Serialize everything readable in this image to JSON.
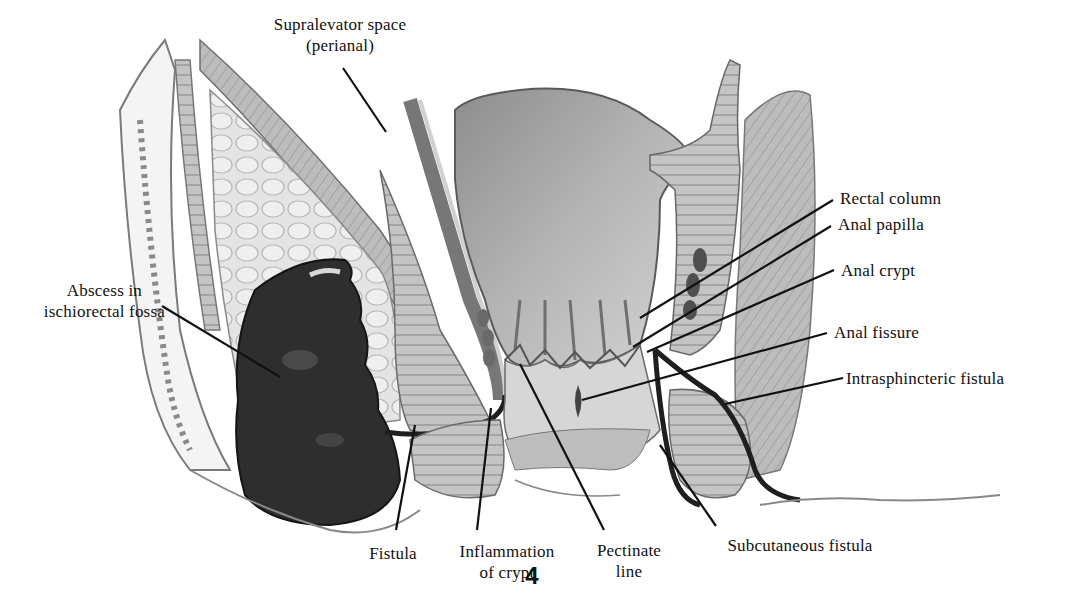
{
  "figure": {
    "number": "4",
    "style": "grayscale medical illustration"
  },
  "colors": {
    "background": "#ffffff",
    "ink": "#111111",
    "abscess": "#2e2e2e",
    "muscle": "#b4b4b4",
    "fat": "#dcdcdc",
    "mucosa": "#a8a8a8",
    "skin_light": "#efefef"
  },
  "labels": [
    {
      "id": "supralevator",
      "line1": "Supralevator space",
      "line2": "(perianal)",
      "x": 340,
      "y": 14,
      "align": "center"
    },
    {
      "id": "abscess",
      "line1": "Abscess in",
      "line2": "ischiorectal fossa",
      "x": 165,
      "y": 280,
      "align": "right"
    },
    {
      "id": "rectal-column",
      "line1": "Rectal column",
      "line2": "",
      "x": 840,
      "y": 188,
      "align": "left"
    },
    {
      "id": "anal-papilla",
      "line1": "Anal papilla",
      "line2": "",
      "x": 838,
      "y": 214,
      "align": "left"
    },
    {
      "id": "anal-crypt",
      "line1": "Anal crypt",
      "line2": "",
      "x": 841,
      "y": 260,
      "align": "left"
    },
    {
      "id": "anal-fissure",
      "line1": "Anal fissure",
      "line2": "",
      "x": 834,
      "y": 322,
      "align": "left"
    },
    {
      "id": "intrasphincteric-fistula",
      "line1": "Intrasphincteric fistula",
      "line2": "",
      "x": 846,
      "y": 368,
      "align": "left"
    },
    {
      "id": "fistula",
      "line1": "Fistula",
      "line2": "",
      "x": 393,
      "y": 543,
      "align": "center"
    },
    {
      "id": "inflammation-of-crypt",
      "line1": "Inflammation",
      "line2": "of crypt",
      "x": 507,
      "y": 541,
      "align": "center"
    },
    {
      "id": "pectinate-line",
      "line1": "Pectinate",
      "line2": "line",
      "x": 629,
      "y": 540,
      "align": "center"
    },
    {
      "id": "subcutaneous-fistula",
      "line1": "Subcutaneous fistula",
      "line2": "",
      "x": 800,
      "y": 535,
      "align": "center"
    }
  ],
  "leader_lines": [
    {
      "id": "supralevator",
      "x1": 343,
      "y1": 68,
      "x2": 386,
      "y2": 132
    },
    {
      "id": "abscess",
      "x1": 162,
      "y1": 306,
      "x2": 280,
      "y2": 377
    },
    {
      "id": "rectal-column",
      "x1": 833,
      "y1": 200,
      "x2": 640,
      "y2": 318
    },
    {
      "id": "anal-papilla",
      "x1": 831,
      "y1": 226,
      "x2": 633,
      "y2": 347
    },
    {
      "id": "anal-crypt",
      "x1": 834,
      "y1": 270,
      "x2": 647,
      "y2": 352
    },
    {
      "id": "anal-fissure",
      "x1": 827,
      "y1": 333,
      "x2": 582,
      "y2": 400
    },
    {
      "id": "intrasphincteric-fistula",
      "x1": 843,
      "y1": 378,
      "x2": 725,
      "y2": 404
    },
    {
      "id": "fistula",
      "x1": 396,
      "y1": 530,
      "x2": 415,
      "y2": 425
    },
    {
      "id": "inflammation-of-crypt",
      "x1": 477,
      "y1": 530,
      "x2": 491,
      "y2": 408
    },
    {
      "id": "pectinate-line",
      "x1": 604,
      "y1": 530,
      "x2": 520,
      "y2": 364
    },
    {
      "id": "subcutaneous-fistula",
      "x1": 716,
      "y1": 526,
      "x2": 660,
      "y2": 445
    }
  ]
}
